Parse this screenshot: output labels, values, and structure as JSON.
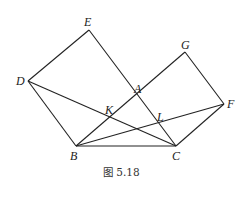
{
  "figure": {
    "caption": "图 5.18",
    "points": {
      "E": {
        "label": "E",
        "x": 89,
        "y": 30
      },
      "D": {
        "label": "D",
        "x": 28,
        "y": 81
      },
      "B": {
        "label": "B",
        "x": 76,
        "y": 146
      },
      "C": {
        "label": "C",
        "x": 176,
        "y": 146
      },
      "G": {
        "label": "G",
        "x": 185,
        "y": 52
      },
      "F": {
        "label": "F",
        "x": 224,
        "y": 104
      },
      "A": {
        "label": "A",
        "x": 138,
        "y": 97
      },
      "K": {
        "label": "K",
        "x": 109,
        "y": 117
      },
      "L": {
        "label": "L",
        "x": 159,
        "y": 124
      }
    },
    "segments": [
      "D-E",
      "E-C",
      "D-B",
      "B-C",
      "C-F",
      "F-G",
      "G-B",
      "D-C",
      "B-F"
    ],
    "stroke_color": "#222222"
  }
}
